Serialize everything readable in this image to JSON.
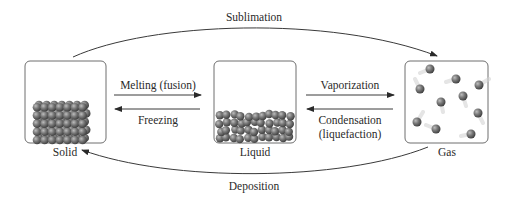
{
  "diagram": {
    "states": [
      {
        "id": "solid",
        "label": "Solid"
      },
      {
        "id": "liquid",
        "label": "Liquid"
      },
      {
        "id": "gas",
        "label": "Gas"
      }
    ],
    "transitions": {
      "sublimation": {
        "label": "Sublimation",
        "from": "solid",
        "to": "gas"
      },
      "deposition": {
        "label": "Deposition",
        "from": "gas",
        "to": "solid"
      },
      "melting": {
        "label": "Melting (fusion)",
        "from": "solid",
        "to": "liquid"
      },
      "freezing": {
        "label": "Freezing",
        "from": "liquid",
        "to": "solid"
      },
      "vaporization": {
        "label": "Vaporization",
        "from": "liquid",
        "to": "gas"
      },
      "condensation": {
        "label_line1": "Condensation",
        "label_line2": "(liquefaction)",
        "from": "gas",
        "to": "liquid"
      }
    },
    "colors": {
      "line": "#3a3a3a",
      "box_border": "#6e6e6e",
      "particle": "#6a6a6a",
      "particle_highlight": "#b8b8b8"
    }
  }
}
